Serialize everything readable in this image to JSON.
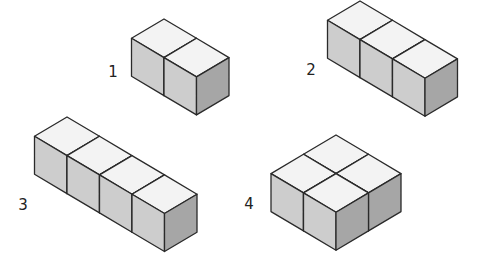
{
  "diagram": {
    "title": "",
    "colors": {
      "top": "#f3f3f3",
      "left": "#cdcdcd",
      "right": "#a6a6a6",
      "edge": "#2a2a2a"
    },
    "iso": {
      "dx": 32.5,
      "dy": 19.3,
      "height": 38
    },
    "shapes": [
      {
        "label": "1",
        "label_pos": [
          113,
          72
        ],
        "apex": [
          164,
          19
        ],
        "cubes": [
          [
            0,
            0
          ],
          [
            1,
            0
          ]
        ]
      },
      {
        "label": "2",
        "label_pos": [
          311,
          70
        ],
        "apex": [
          360,
          1
        ],
        "cubes": [
          [
            0,
            0
          ],
          [
            1,
            0
          ],
          [
            2,
            0
          ]
        ]
      },
      {
        "label": "3",
        "label_pos": [
          23,
          205
        ],
        "apex": [
          67,
          117
        ],
        "cubes": [
          [
            0,
            0
          ],
          [
            1,
            0
          ],
          [
            2,
            0
          ],
          [
            3,
            0
          ]
        ]
      },
      {
        "label": "4",
        "label_pos": [
          249,
          204
        ],
        "apex": [
          336,
          135
        ],
        "cubes": [
          [
            0,
            0
          ],
          [
            1,
            0
          ],
          [
            0,
            1
          ],
          [
            1,
            1
          ]
        ]
      }
    ]
  }
}
